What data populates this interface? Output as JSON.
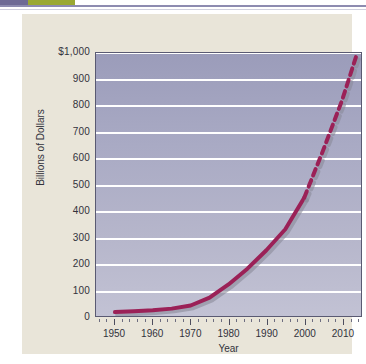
{
  "header_strip": {
    "block_left_color": "#6e6a95",
    "block_right_color": "#9aa832",
    "rule_color": "#8d8bb0"
  },
  "figure": {
    "panel_color": "#e9e5d9",
    "plot_background_top": "#9b9cba",
    "plot_background_bottom": "#c2c2d4",
    "gridline_color": "#ffffff",
    "border_color": "#5a5a72"
  },
  "chart_data": {
    "type": "line",
    "title": "",
    "xlabel": "Year",
    "ylabel": "Billions of Dollars",
    "xlim": [
      1945,
      2015
    ],
    "ylim": [
      0,
      1000
    ],
    "ytick_labels": [
      "$1,000",
      "900",
      "800",
      "700",
      "600",
      "500",
      "400",
      "300",
      "200",
      "100",
      "0"
    ],
    "ytick_values": [
      1000,
      900,
      800,
      700,
      600,
      500,
      400,
      300,
      200,
      100,
      0
    ],
    "xtick_labels": [
      "1950",
      "1960",
      "1970",
      "1980",
      "1990",
      "2000",
      "2010"
    ],
    "xtick_values": [
      1950,
      1960,
      1970,
      1980,
      1990,
      2000,
      2010
    ],
    "grid": "horizontal",
    "legend": "none",
    "series": [
      {
        "name": "Actual",
        "style": "solid",
        "color": "#9b2157",
        "x": [
          1950,
          1955,
          1960,
          1965,
          1970,
          1975,
          1980,
          1985,
          1990,
          1995,
          2000
        ],
        "values": [
          15,
          18,
          22,
          28,
          40,
          70,
          120,
          180,
          250,
          330,
          450
        ]
      },
      {
        "name": "Projected",
        "style": "dashed",
        "color": "#9b2157",
        "x": [
          2000,
          2005,
          2010,
          2014
        ],
        "values": [
          450,
          630,
          820,
          1000
        ]
      }
    ],
    "shadow_color": "#8a8a9a",
    "annotations": []
  }
}
